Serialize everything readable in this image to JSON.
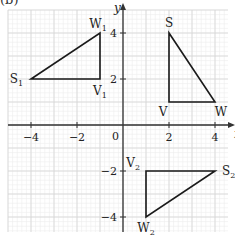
{
  "part_label": "(b)",
  "axes": {
    "x_label": "x",
    "y_label": "y",
    "origin_label": "0",
    "x_ticks": [
      {
        "value": -4,
        "label": "−4"
      },
      {
        "value": -2,
        "label": "−2"
      },
      {
        "value": 2,
        "label": "2"
      },
      {
        "value": 4,
        "label": "4"
      }
    ],
    "y_ticks": [
      {
        "value": 4,
        "label": "4"
      },
      {
        "value": 2,
        "label": "2"
      },
      {
        "value": -2,
        "label": "−2"
      },
      {
        "value": -4,
        "label": "−4"
      }
    ],
    "range_x": [
      -4.9,
      4.6
    ],
    "range_y": [
      -4.7,
      5.0
    ],
    "grid": true,
    "minor_grid_step": 0.2
  },
  "triangles": [
    {
      "name": "SVW",
      "vertices": [
        {
          "label": "S",
          "sub": "",
          "x": 2,
          "y": 4
        },
        {
          "label": "V",
          "sub": "",
          "x": 2,
          "y": 1
        },
        {
          "label": "W",
          "sub": "",
          "x": 4,
          "y": 1
        }
      ]
    },
    {
      "name": "S1V1W1",
      "vertices": [
        {
          "label": "S",
          "sub": "1",
          "x": -4,
          "y": 2
        },
        {
          "label": "V",
          "sub": "1",
          "x": -1,
          "y": 2
        },
        {
          "label": "W",
          "sub": "1",
          "x": -1,
          "y": 4
        }
      ]
    },
    {
      "name": "S2V2W2",
      "vertices": [
        {
          "label": "S",
          "sub": "2",
          "x": 4,
          "y": -2
        },
        {
          "label": "V",
          "sub": "2",
          "x": 1,
          "y": -2
        },
        {
          "label": "W",
          "sub": "2",
          "x": 1,
          "y": -4
        }
      ]
    }
  ],
  "colors": {
    "grid_minor": "#ececec",
    "grid_major": "#d6d6d6",
    "axis": "#333333",
    "shape": "#1a1a1a"
  }
}
